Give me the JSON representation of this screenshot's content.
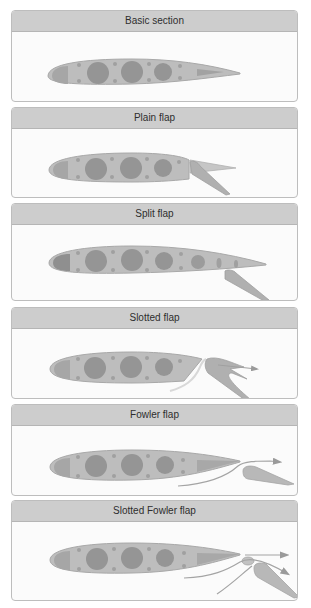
{
  "colors": {
    "panel_header_bg": "#cdcdcd",
    "panel_border": "#bdbdbd",
    "panel_bg": "#fbfbfb",
    "airfoil_fill": "#bdbdbd",
    "airfoil_outline": "#a8a8a8",
    "tank_fill": "#8f8f8f",
    "flap_fill": "#b0b0b0",
    "airflow_arrow": "#a0a0a0"
  },
  "panels": [
    {
      "title": "Basic section",
      "type": "basic"
    },
    {
      "title": "Plain flap",
      "type": "plain"
    },
    {
      "title": "Split flap",
      "type": "split"
    },
    {
      "title": "Slotted flap",
      "type": "slotted"
    },
    {
      "title": "Fowler flap",
      "type": "fowler"
    },
    {
      "title": "Slotted Fowler flap",
      "type": "slotted-fowler"
    }
  ]
}
